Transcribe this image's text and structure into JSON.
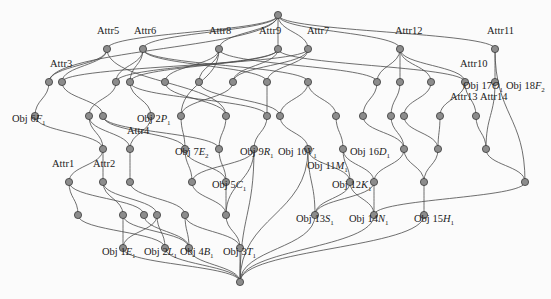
{
  "diagram": {
    "type": "concept-lattice",
    "attribute_labels": [
      {
        "text": "Attr5",
        "x": 97,
        "y": 38
      },
      {
        "text": "Attr6",
        "x": 134,
        "y": 38
      },
      {
        "text": "Attr8",
        "x": 209,
        "y": 38
      },
      {
        "text": "Attr9",
        "x": 259,
        "y": 38
      },
      {
        "text": "Attr7",
        "x": 307,
        "y": 38
      },
      {
        "text": "Attr12",
        "x": 395,
        "y": 38
      },
      {
        "text": "Attr11",
        "x": 487,
        "y": 38
      },
      {
        "text": "Attr3",
        "x": 50,
        "y": 71
      },
      {
        "text": "Attr10",
        "x": 460,
        "y": 71
      },
      {
        "text": "Attr4",
        "x": 127,
        "y": 138
      },
      {
        "text": "Attr13",
        "x": 450,
        "y": 104
      },
      {
        "text": "Attr14",
        "x": 480,
        "y": 104
      },
      {
        "text": "Attr1",
        "x": 52,
        "y": 171
      },
      {
        "text": "Attr2",
        "x": 93,
        "y": 171
      }
    ],
    "object_labels": [
      {
        "text": "Obj 6",
        "sym": "F",
        "sub": "1",
        "x": 12,
        "y": 120
      },
      {
        "text": "Obj 2",
        "sym": "P",
        "sub": "1",
        "x": 137,
        "y": 120
      },
      {
        "text": "Obj 17",
        "sym": "O",
        "sub": "1",
        "x": 463,
        "y": 87
      },
      {
        "text": "Obj 18",
        "sym": "F",
        "sub": "2",
        "x": 506,
        "y": 87
      },
      {
        "text": "Obj 7",
        "sym": "E",
        "sub": "2",
        "x": 175,
        "y": 153
      },
      {
        "text": "Obj 9",
        "sym": "R",
        "sub": "1",
        "x": 240,
        "y": 153
      },
      {
        "text": "Obj 10",
        "sym": "V",
        "sub": "1",
        "x": 278,
        "y": 153
      },
      {
        "text": "Obj 16",
        "sym": "D",
        "sub": "1",
        "x": 350,
        "y": 153
      },
      {
        "text": "Obj 11",
        "sym": "M",
        "sub": "1",
        "x": 307,
        "y": 167
      },
      {
        "text": "Obj 5",
        "sym": "C",
        "sub": "1",
        "x": 212,
        "y": 186
      },
      {
        "text": "Obj 12",
        "sym": "K",
        "sub": "1",
        "x": 332,
        "y": 186
      },
      {
        "text": "Obj 13",
        "sym": "S",
        "sub": "1",
        "x": 296,
        "y": 220
      },
      {
        "text": "Obj 14",
        "sym": "N",
        "sub": "1",
        "x": 349,
        "y": 220
      },
      {
        "text": "Obj 15",
        "sym": "H",
        "sub": "1",
        "x": 414,
        "y": 220
      },
      {
        "text": "Obj 1",
        "sym": "E",
        "sub": "1",
        "x": 102,
        "y": 253
      },
      {
        "text": "Obj 2",
        "sym": "L",
        "sub": "1",
        "x": 144,
        "y": 253
      },
      {
        "text": "Obj 4",
        "sym": "B",
        "sub": "1",
        "x": 180,
        "y": 253
      },
      {
        "text": "Obj 3",
        "sym": "T",
        "sub": "1",
        "x": 223,
        "y": 253
      }
    ],
    "colors": {
      "node_fill": "#8c8c8c",
      "edge": "#4a4a4a",
      "text": "#222222"
    }
  }
}
